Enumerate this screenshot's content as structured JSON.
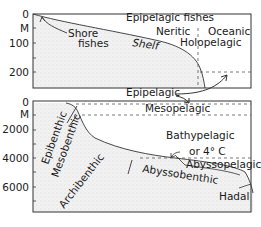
{
  "top_panel": {
    "y_ticks": [
      "0",
      "M",
      "100",
      "200"
    ],
    "labels": {
      "shore_fishes_1": "Shore",
      "shore_fishes_2": "fishes",
      "epipelagic_fishes": "Epipelagic fishes",
      "neritic": "Neritic",
      "oceanic": "Oceanic",
      "shelf": "Shelf",
      "holopelagic": "Holopelagic"
    }
  },
  "middle_label": "Epipelagic",
  "bottom_panel": {
    "y_ticks": [
      "0",
      "M",
      "2000",
      "4000",
      "6000"
    ],
    "labels": {
      "mesopelagic": "Mesopelagic",
      "bathypelagic": "Bathypelagic",
      "or_4c": "or 4° C",
      "abyssopelagic": "Abyssopelagic",
      "epibenthic": "Epibenthic",
      "mesobenthic": "Mesobenthic",
      "archibenthic": "Archibenthic",
      "abyssobenthic": "Abyssobenthic",
      "hadal": "Hadal"
    }
  },
  "colors": {
    "seafloor_fill": "#ececec",
    "line": "#333333"
  }
}
